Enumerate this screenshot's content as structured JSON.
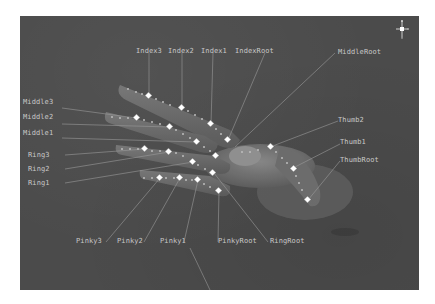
{
  "viewport": {
    "background": "#4b4b4b",
    "bone_color": "#ffffff",
    "leader_color": "#9a9a9a",
    "flesh_color": "#6a6a6a"
  },
  "labels": {
    "index3": "Index3",
    "index2": "Index2",
    "index1": "Index1",
    "index_root": "IndexRoot",
    "middle_root": "MiddleRoot",
    "middle3": "Middle3",
    "middle2": "Middle2",
    "middle1": "Middle1",
    "ring3": "Ring3",
    "ring2": "Ring2",
    "ring1": "Ring1",
    "thumb2": "Thumb2",
    "thumb1": "Thumb1",
    "thumb_root": "ThumbRoot",
    "pinky3": "Pinky3",
    "pinky2": "Pinky2",
    "pinky1": "Pinky1",
    "pinky_root": "PinkyRoot",
    "ring_root": "RingRoot"
  },
  "gizmo": {
    "icon": "view-orientation-gizmo"
  }
}
